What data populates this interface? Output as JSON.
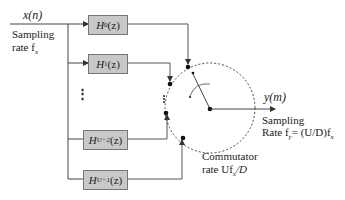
{
  "input": {
    "signal": "x(n)",
    "rate_label_1": "Sampling",
    "rate_label_2": "rate f",
    "rate_sub": "x"
  },
  "filters": [
    {
      "name": "H",
      "sub": "0",
      "arg": "(z)"
    },
    {
      "name": "H",
      "sub": "1",
      "arg": "(z)"
    },
    {
      "name": "H",
      "sub": "U−2",
      "arg": "(z)"
    },
    {
      "name": "H",
      "sub": "U−1",
      "arg": "(z)"
    }
  ],
  "ellipsis": "⋮",
  "output": {
    "signal": "y(m)",
    "rate_label_1": "Sampling",
    "rate_label_2": "Rate f",
    "rate_sub": "y",
    "rate_expr": "= (U/D)f",
    "rate_expr_sub": "x"
  },
  "commutator": {
    "label_1": "Commutator",
    "label_2": "rate Uf",
    "label_2_sub": "x",
    "label_2_tail": "/D"
  }
}
